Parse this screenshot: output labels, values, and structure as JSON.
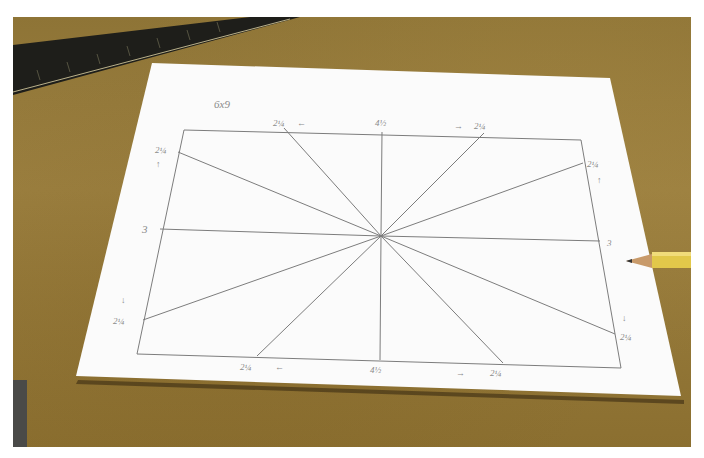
{
  "scene": {
    "description": "Sheet of paper on a brown work surface with a pencil-drawn radial line pattern inside a rectangle; a ruler at top-left and a yellow pencil at right",
    "colors": {
      "surface": "#957a3a",
      "paper": "#fbfbfb",
      "pencil_line": "#7c7c7c",
      "pencil_body": "#e2c84a",
      "ruler": "#1e1e1a"
    }
  },
  "annotations": {
    "size_note": "6x9",
    "top_left": "2¼",
    "top_left_arrow": "←",
    "top_center": "4½",
    "top_right": "2¼",
    "top_right_arrow": "→",
    "left_top": "2¼",
    "left_top_arrow": "↑",
    "left_middle": "3",
    "left_bottom": "2¼",
    "left_bottom_arrow": "↓",
    "right_top": "2¼",
    "right_top_arrow": "↑",
    "right_middle": "3",
    "right_bottom": "2¼",
    "right_bottom_arrow": "↓",
    "bottom_left": "2¼",
    "bottom_left_arrow": "←",
    "bottom_center": "4½",
    "bottom_right": "2¼",
    "bottom_right_arrow": "→"
  }
}
